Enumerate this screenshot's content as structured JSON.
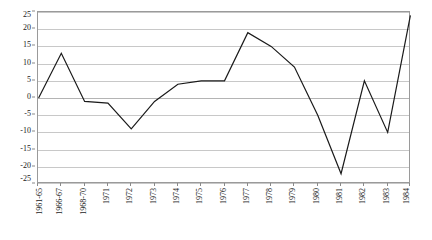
{
  "chart_data": {
    "type": "line",
    "title": "",
    "subtitle": "",
    "xlabel": "",
    "ylabel": "",
    "ylim": [
      -25,
      25
    ],
    "ytick_values": [
      25,
      20,
      15,
      10,
      5,
      0,
      -5,
      -10,
      -15,
      -20,
      -25
    ],
    "ytick_labels": [
      "25",
      "20",
      "15",
      "10",
      "5",
      "0",
      "-5",
      "-10",
      "-15",
      "-20",
      "-25"
    ],
    "grid": true,
    "legend": false,
    "legend_position": "none",
    "categories": [
      "1961-65",
      "1966-67",
      "1968-70",
      "1971",
      "1972",
      "1973",
      "1974",
      "1975",
      "1976",
      "1977",
      "1978",
      "1979",
      "1980",
      "1981",
      "1982",
      "1983",
      "1984"
    ],
    "series": [
      {
        "name": "series-1",
        "color": "#1a1a1a",
        "values": [
          0,
          13,
          -1,
          -1.5,
          -9,
          -1,
          4,
          5,
          5,
          19,
          15,
          9,
          -5,
          -22,
          5,
          -10,
          24
        ]
      }
    ]
  },
  "style": {
    "background": "#ffffff",
    "grid_color": "#c8c8c8",
    "frame_color": "#9a9a9a",
    "line_color": "#1a1a1a",
    "text_color": "#1a1a1a"
  }
}
